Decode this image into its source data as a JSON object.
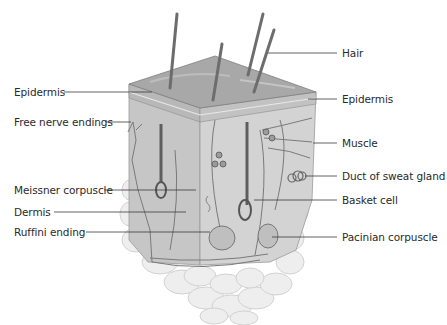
{
  "diagram": {
    "labels_left": [
      {
        "id": "epidermis-left",
        "text": "Epidermis",
        "x": 14,
        "y": 86,
        "line": [
          64,
          92,
          152,
          92
        ]
      },
      {
        "id": "free-nerve-endings",
        "text": "Free nerve endings",
        "x": 14,
        "y": 116,
        "line": [
          106,
          122,
          131,
          122
        ]
      },
      {
        "id": "meissner-corpuscle",
        "text": "Meissner corpuscle",
        "x": 14,
        "y": 184,
        "line": [
          104,
          190,
          196,
          190
        ]
      },
      {
        "id": "dermis",
        "text": "Dermis",
        "x": 14,
        "y": 206,
        "line": [
          54,
          212,
          186,
          212
        ]
      },
      {
        "id": "ruffini-ending",
        "text": "Ruffini ending",
        "x": 14,
        "y": 226,
        "line": [
          86,
          232,
          210,
          232
        ]
      }
    ],
    "labels_right": [
      {
        "id": "hair",
        "text": "Hair",
        "x": 342,
        "y": 47,
        "line": [
          268,
          53,
          337,
          53
        ]
      },
      {
        "id": "epidermis-right",
        "text": "Epidermis",
        "x": 342,
        "y": 93,
        "line": [
          308,
          99,
          337,
          99
        ]
      },
      {
        "id": "muscle",
        "text": "Muscle",
        "x": 342,
        "y": 137,
        "line": [
          313,
          143,
          337,
          143
        ]
      },
      {
        "id": "duct-of-sweat-gland",
        "text": "Duct of sweat gland",
        "x": 342,
        "y": 170,
        "line": [
          305,
          176,
          337,
          176
        ]
      },
      {
        "id": "basket-cell",
        "text": "Basket cell",
        "x": 342,
        "y": 194,
        "line": [
          254,
          200,
          337,
          200
        ]
      },
      {
        "id": "pacinian-corpuscle",
        "text": "Pacinian corpuscle",
        "x": 342,
        "y": 231,
        "line": [
          272,
          237,
          337,
          237
        ]
      }
    ],
    "colors": {
      "label_text": "#2a2a2a",
      "leader_line": "#3a3a3a",
      "epidermis_top": "#a9a9a9",
      "dermis": "#c8c8c8",
      "subcutaneous_fat": "#e6e6e6",
      "hair": "#6d6d6d"
    }
  }
}
